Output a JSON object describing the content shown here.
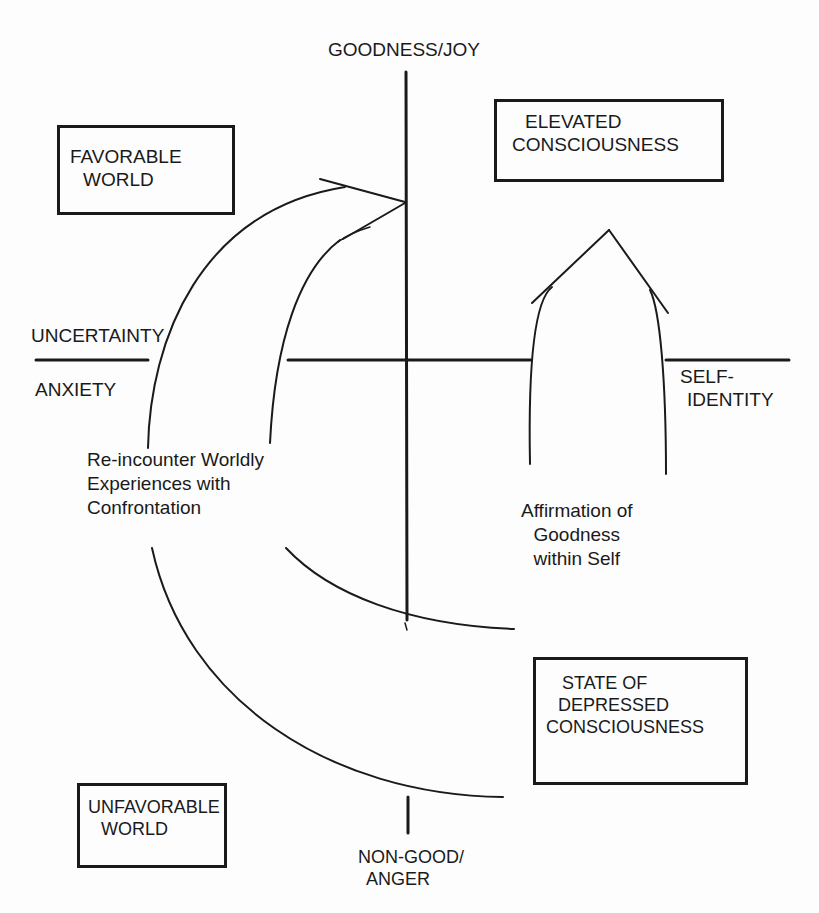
{
  "axes": {
    "top": {
      "text": "GOODNESS/JOY"
    },
    "bottom": {
      "line1": "NON-GOOD/",
      "line2": "ANGER"
    },
    "left_above": {
      "text": "UNCERTAINTY"
    },
    "left_below": {
      "text": "ANXIETY"
    },
    "right": {
      "line1": "SELF-",
      "line2": "IDENTITY"
    }
  },
  "boxes": {
    "favorable_world": {
      "line1": "FAVORABLE",
      "line2": "WORLD"
    },
    "elevated_consciousness": {
      "line1": "ELEVATED",
      "line2": "CONSCIOUSNESS"
    },
    "depressed_consciousness": {
      "line1": "STATE OF",
      "line2": "DEPRESSED",
      "line3": "CONSCIOUSNESS"
    },
    "unfavorable_world": {
      "line1": "UNFAVORABLE",
      "line2": "WORLD"
    }
  },
  "annotations": {
    "reencounter": {
      "line1": "Re-incounter Worldly",
      "line2": "Experiences with",
      "line3": "Confrontation"
    },
    "affirmation": {
      "line1": "Affirmation of",
      "line2": "Goodness",
      "line3": "within Self"
    }
  },
  "colors": {
    "ink": "#1a1a1a",
    "background": "#fdfdfd"
  }
}
